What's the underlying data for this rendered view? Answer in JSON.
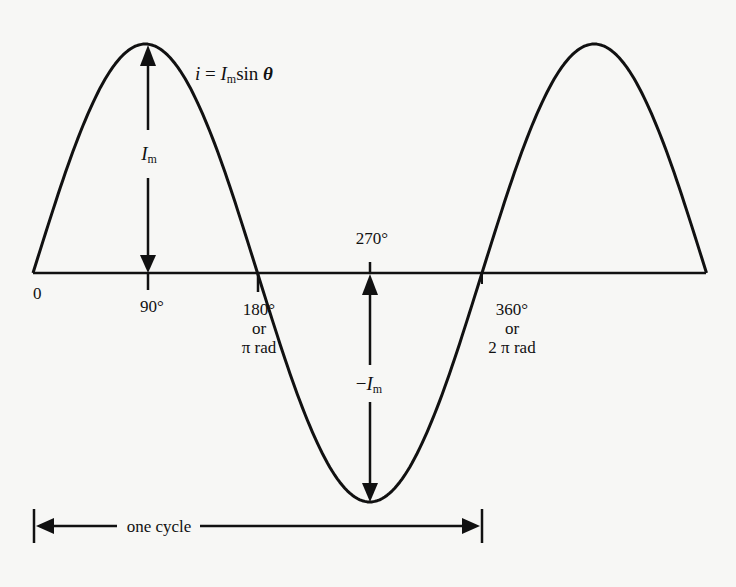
{
  "figure": {
    "equation": {
      "lhs": "i",
      "eq": " = ",
      "symbol": "I",
      "subscript": "m",
      "func": "sin ",
      "var": "θ"
    },
    "amplitude_label": {
      "symbol": "I",
      "subscript": "m"
    },
    "neg_amplitude_label": {
      "prefix": "−",
      "symbol": "I",
      "subscript": "m"
    },
    "axis_labels": {
      "origin": "0",
      "deg90": "90°",
      "deg180": "180°",
      "deg180_or": "or",
      "deg180_rad": "π rad",
      "deg270": "270°",
      "deg360": "360°",
      "deg360_or": "or",
      "deg360_rad": "2 π rad"
    },
    "cycle_label": "one cycle",
    "colors": {
      "ink": "#111111",
      "paper": "#f7f7f5"
    }
  },
  "chart_data": {
    "type": "line",
    "xlabel": "θ",
    "ylabel": "i",
    "x_ticks": [
      "0",
      "90°",
      "180° or π rad",
      "270°",
      "360° or 2π rad"
    ],
    "x": [
      0,
      45,
      90,
      135,
      180,
      225,
      270,
      315,
      360,
      405,
      450,
      495,
      540
    ],
    "series": [
      {
        "name": "i = Im sin θ",
        "values": [
          0,
          0.707,
          1,
          0.707,
          0,
          -0.707,
          -1,
          -0.707,
          0,
          0.707,
          1,
          0.707,
          0
        ]
      }
    ],
    "annotations": [
      {
        "text": "Im",
        "at": 90,
        "type": "double-arrow",
        "from": 0,
        "to": 1
      },
      {
        "text": "−Im",
        "at": 270,
        "type": "double-arrow",
        "from": 0,
        "to": -1
      },
      {
        "text": "one cycle",
        "type": "span",
        "from": 0,
        "to": 360
      }
    ],
    "ylim": [
      -1,
      1
    ],
    "xlim": [
      0,
      540
    ],
    "grid": false,
    "legend": "none"
  }
}
